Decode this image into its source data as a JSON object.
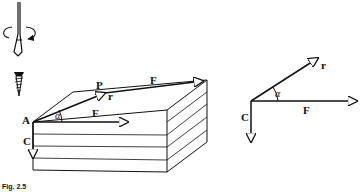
{
  "figure": {
    "caption": "Fig. 2.5",
    "left_diagram": {
      "labels": {
        "point_p": "P",
        "point_a": "A",
        "force_top": "F",
        "force_front": "F",
        "couple": "C",
        "radius": "r",
        "angle": "α"
      },
      "objects": [
        "screwdriver",
        "rotation-arrow",
        "wood-screw",
        "layered-block"
      ]
    },
    "right_diagram": {
      "labels": {
        "radius": "r",
        "angle": "α",
        "force": "F",
        "couple": "C"
      }
    },
    "colors": {
      "ink": "#111111",
      "background": "#ffffff"
    }
  }
}
